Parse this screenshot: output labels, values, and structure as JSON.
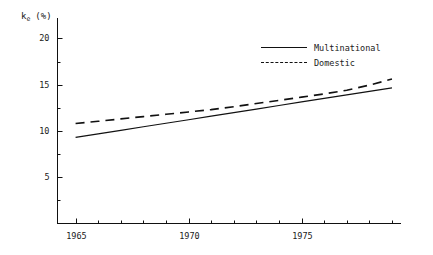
{
  "chart_data": {
    "type": "line",
    "title": "",
    "xlabel": "",
    "ylabel": "k_e (%)",
    "ylabel_base": "k",
    "ylabel_sub": "e",
    "ylabel_unit": "(%)",
    "x": [
      1965,
      1966,
      1967,
      1968,
      1969,
      1970,
      1971,
      1972,
      1973,
      1974,
      1975,
      1976,
      1977,
      1978,
      1979
    ],
    "xlim": [
      1964.2,
      1979.4
    ],
    "ylim": [
      0,
      22.2
    ],
    "xticks_major": [
      1965,
      1970,
      1975
    ],
    "xtick_labels": [
      "1965",
      "1970",
      "1975"
    ],
    "xticks_minor": [
      1966,
      1967,
      1968,
      1969,
      1971,
      1972,
      1973,
      1974,
      1976,
      1977,
      1978,
      1979
    ],
    "yticks_major": [
      5,
      10,
      15,
      20
    ],
    "ytick_labels": [
      "5",
      "10",
      "15",
      "20"
    ],
    "yticks_minor": [
      2.5,
      7.5,
      12.5,
      17.5
    ],
    "grid": false,
    "legend_position": "top-right",
    "series": [
      {
        "name": "Multinational",
        "style": "solid",
        "color": "#111111",
        "values": [
          9.3,
          9.68,
          10.06,
          10.45,
          10.83,
          11.21,
          11.6,
          11.98,
          12.36,
          12.75,
          13.13,
          13.51,
          13.9,
          14.28,
          14.66
        ]
      },
      {
        "name": "Domestic",
        "style": "dashed",
        "color": "#111111",
        "values": [
          10.8,
          11.04,
          11.3,
          11.55,
          11.8,
          12.05,
          12.3,
          12.62,
          12.96,
          13.3,
          13.65,
          14.0,
          14.4,
          14.95,
          15.6
        ]
      }
    ]
  },
  "legend": {
    "items": [
      {
        "label": "Multinational",
        "style": "solid"
      },
      {
        "label": "Domestic",
        "style": "dashed"
      }
    ]
  }
}
